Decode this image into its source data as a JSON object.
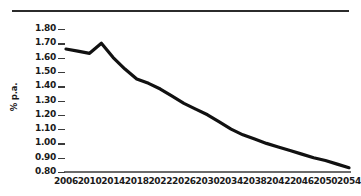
{
  "chart_data": {
    "type": "line",
    "title": "",
    "xlabel": "",
    "ylabel": "% p.a.",
    "ylim": [
      0.8,
      1.8
    ],
    "xlim": [
      2006,
      2054
    ],
    "grid": false,
    "legend": null,
    "y_ticks": [
      "1.80",
      "1.70",
      "1.60",
      "1.50",
      "1.40",
      "1.30",
      "1.20",
      "1.10",
      "1.00",
      "0.90",
      "0.80"
    ],
    "y_tick_values": [
      1.8,
      1.7,
      1.6,
      1.5,
      1.4,
      1.3,
      1.2,
      1.1,
      1.0,
      0.9,
      0.8
    ],
    "x_ticks": [
      "2006",
      "2010",
      "2014",
      "2018",
      "2022",
      "2026",
      "2030",
      "2034",
      "2038",
      "2042",
      "2046",
      "2050",
      "2054"
    ],
    "x_tick_values": [
      2006,
      2010,
      2014,
      2018,
      2022,
      2026,
      2030,
      2034,
      2038,
      2042,
      2046,
      2050,
      2054
    ],
    "series": [
      {
        "name": "Growth rate",
        "color": "#111111",
        "x": [
          2006,
          2008,
          2010,
          2012,
          2014,
          2016,
          2018,
          2020,
          2022,
          2024,
          2026,
          2028,
          2030,
          2032,
          2034,
          2036,
          2038,
          2040,
          2042,
          2044,
          2046,
          2048,
          2050,
          2052,
          2054
        ],
        "values": [
          1.66,
          1.645,
          1.63,
          1.7,
          1.6,
          1.52,
          1.45,
          1.42,
          1.38,
          1.33,
          1.28,
          1.24,
          1.2,
          1.15,
          1.1,
          1.06,
          1.03,
          1.0,
          0.975,
          0.95,
          0.925,
          0.9,
          0.88,
          0.855,
          0.83
        ]
      }
    ]
  },
  "axes": {
    "baseline_value": 0.8,
    "line_color": "#111111",
    "axis_color": "#3a3a3a",
    "text_color": "#1a1a1a"
  }
}
